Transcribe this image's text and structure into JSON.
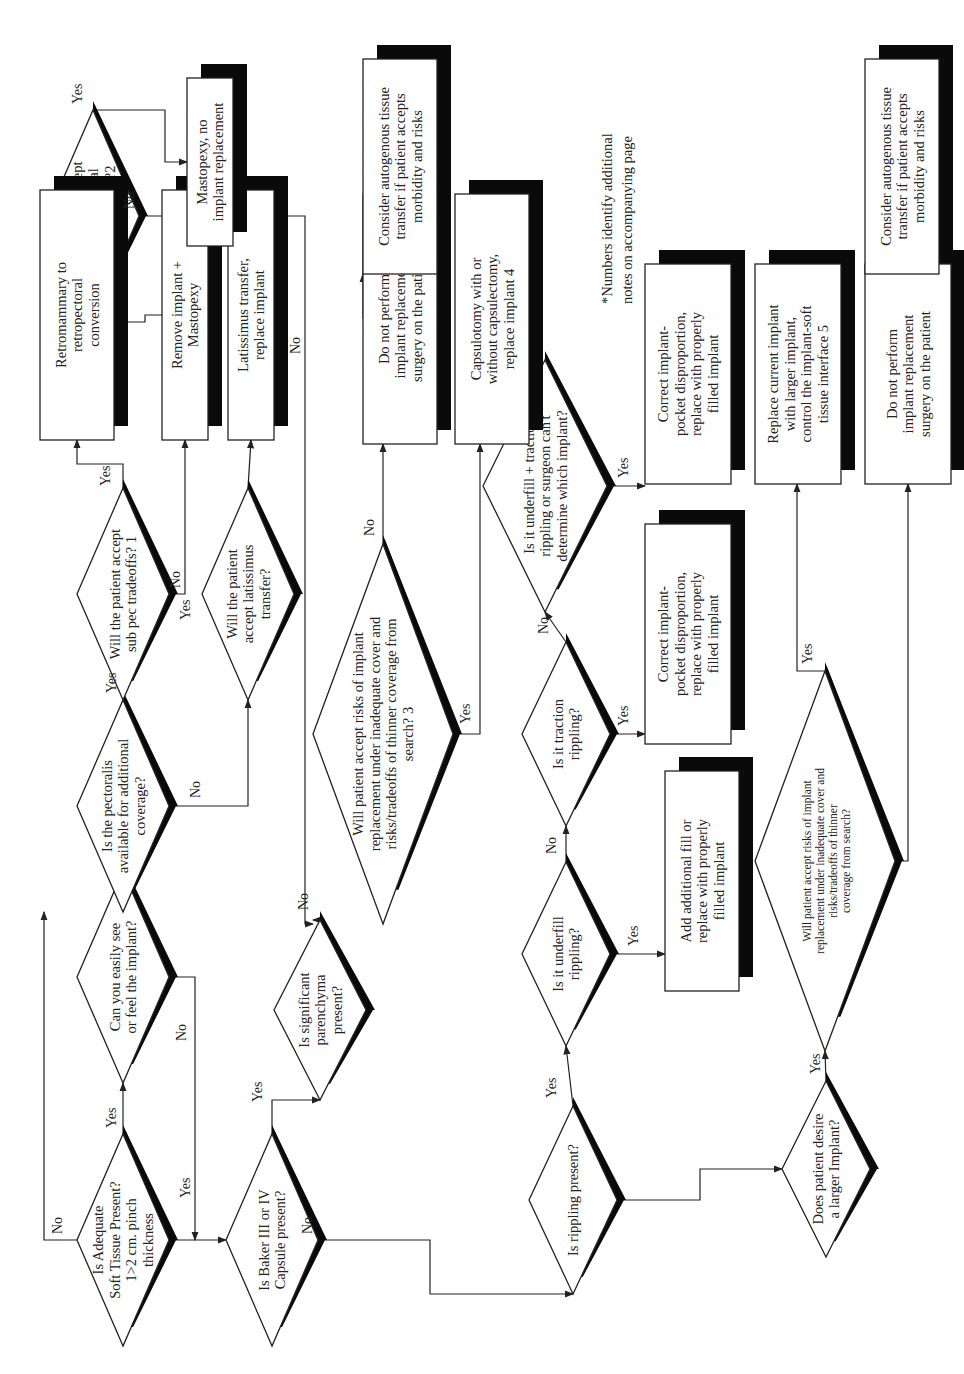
{
  "diagram": {
    "orientation": "rotated 90 degrees counter-clockwise",
    "decisions": {
      "d1": [
        "Is Adequate",
        "Soft Tissue Present?",
        "1>2 cm. pinch",
        "thickness"
      ],
      "d2": [
        "Can you easily see",
        "or feel the implant?"
      ],
      "d3": [
        "Is the pectoralis",
        "available for additional",
        "coverage?"
      ],
      "d4": [
        "Will the patient accept",
        "sub pec tradeoffs? 1"
      ],
      "d5": [
        "Will the patient",
        "accept latissimus",
        "transfer?"
      ],
      "d6": [
        "Will patient accept",
        "implant removal",
        "and mastopexy?2"
      ],
      "d7": [
        "Is Baker III or IV",
        "Capsule present?"
      ],
      "d8": [
        "Is significant",
        "parenchyma",
        "present?"
      ],
      "d9": [
        "Will patient accept risks of implant",
        "replacement under inadequate cover and",
        "risks/tradeoffs of thinner coverage from",
        "search? 3"
      ],
      "d10": [
        "Is rippling present?"
      ],
      "d11": [
        "Is it underfill",
        "rippling?"
      ],
      "d12": [
        "Is it traction",
        "rippling?"
      ],
      "d13": [
        "Is it underfill + traction",
        "rippling or surgeon can't",
        "determine which implant?"
      ],
      "d14": [
        "Does patient desire",
        "a larger Implant?"
      ],
      "d15": [
        "Will patient accept risks of implant",
        "replacement under inadequate cover and",
        "risks/tradeoffs of thinner",
        "coverage from search?"
      ]
    },
    "actions": {
      "a1": [
        "Retromammary to",
        "retropectoral",
        "conversion"
      ],
      "a2": [
        "Remove implant +",
        "Mastopexy"
      ],
      "a3": [
        "Latissimus transfer,",
        "replace implant"
      ],
      "a4": [
        "Mastopexy, no",
        "implant replacement"
      ],
      "a5": [
        "Do not perform",
        "implant replacement",
        "surgery on the patient"
      ],
      "a6": [
        "Capsulotomy with or",
        "without capsulectomy,",
        "replace implant 4"
      ],
      "a7": [
        "Consider autogenous tissue",
        "transfer if patient accepts",
        "morbidity and risks"
      ],
      "a8": [
        "Add additional fill or",
        "replace with properly",
        "filled implant"
      ],
      "a9": [
        "Correct implant-",
        "pocket disproportion,",
        "replace with properly",
        "filled implant"
      ],
      "a10": [
        "Correct implant-",
        "pocket disproportion,",
        "replace with properly",
        "filled implant"
      ],
      "a11": [
        "Replace current implant",
        "with larger implant,",
        "control the implant-soft",
        "tissue interface 5"
      ],
      "a12": [
        "Do not perform",
        "implant replacement",
        "surgery on the patient"
      ],
      "a13": [
        "Consider autogenous tissue",
        "transfer if patient accepts",
        "morbidity and risks"
      ]
    },
    "labels": {
      "yes": "Yes",
      "no": "No"
    },
    "footnote": [
      "*Numbers identify additional",
      "notes on accompanying page"
    ]
  }
}
